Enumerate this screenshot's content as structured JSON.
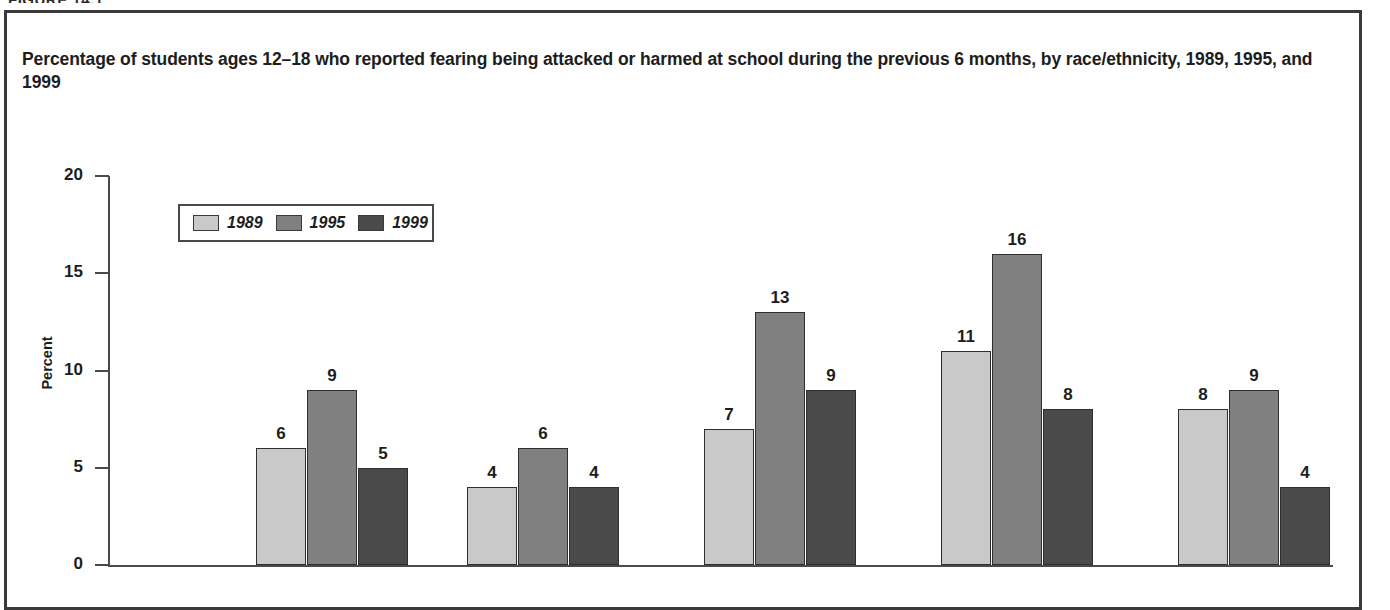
{
  "figure_header": "FIGURE 14.1",
  "figure_title": "Percentage of students ages 12–18 who reported fearing being attacked or harmed at school during the previous 6 months, by race/ethnicity, 1989, 1995, and 1999",
  "axis": {
    "y_title": "Percent",
    "y_ticks": [
      "0",
      "5",
      "10",
      "15",
      "20"
    ]
  },
  "legend": {
    "entries": [
      {
        "label": "1989",
        "color": "#c9c9c9"
      },
      {
        "label": "1995",
        "color": "#808080"
      },
      {
        "label": "1999",
        "color": "#4a4a4a"
      }
    ]
  },
  "chart_data": {
    "type": "bar",
    "title": "Percentage of students ages 12–18 who reported fearing being attacked or harmed at school during the previous 6 months, by race/ethnicity, 1989, 1995, and 1999",
    "xlabel": "",
    "ylabel": "Percent",
    "ylim": [
      0,
      20
    ],
    "yticks": [
      0,
      5,
      10,
      15,
      20
    ],
    "grid": false,
    "legend_position": "upper-left",
    "categories": [
      "Group 1",
      "Group 2",
      "Group 3",
      "Group 4",
      "Group 5"
    ],
    "series": [
      {
        "name": "1989",
        "color": "#c9c9c9",
        "values": [
          6,
          4,
          7,
          11,
          8
        ]
      },
      {
        "name": "1995",
        "color": "#808080",
        "values": [
          9,
          6,
          13,
          16,
          9
        ]
      },
      {
        "name": "1999",
        "color": "#4a4a4a",
        "values": [
          5,
          4,
          9,
          8,
          4
        ]
      }
    ],
    "bar_labels": [
      [
        "6",
        "9",
        "5"
      ],
      [
        "4",
        "6",
        "4"
      ],
      [
        "7",
        "13",
        "9"
      ],
      [
        "11",
        "16",
        "8"
      ],
      [
        "8",
        "9",
        "4"
      ]
    ]
  }
}
